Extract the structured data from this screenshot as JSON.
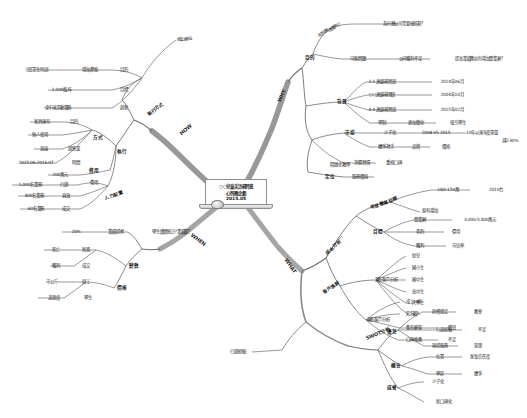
{
  "document": {
    "type": "mind-map",
    "title_lines": [
      "○○兒童美語補習班",
      "心智圖企劃",
      "2015.05"
    ],
    "center_icon": "laptop-icon"
  },
  "branches": [
    {
      "id": "why",
      "label": "WHY",
      "color": "#7a7a7a",
      "children": [
        {
          "label": "目的",
          "children": [
            {
              "label": "如何營運獲利？",
              "children": [
                {
                  "label": "為什麼公司需要被規劃？"
                }
              ]
            },
            {
              "label": "可能問題",
              "children": [
                {
                  "label": "公司獲利不足",
                  "children": [
                    {
                      "label": "提高業績應如何增加營業額？"
                    }
                  ]
                }
              ]
            }
          ]
        },
        {
          "label": "背景",
          "children": [
            {
              "label": "1-1 連鎖補習班",
              "value": "2014年06月"
            },
            {
              "label": "○○連鎖補習班",
              "value": "2004年10月"
            },
            {
              "label": "4-4 連鎖補習班",
              "value": "2015年02月"
            },
            {
              "label": "學制",
              "value": "更加簡化",
              "extra": "吸引學生"
            }
          ]
        },
        {
          "label": "市場",
          "children": [
            {
              "label": "少子化",
              "value": "2008 VS 2015",
              "extra": "10年以來年度單量",
              "extra2": "減少30%"
            },
            {
              "label": "競爭對手",
              "value": "品質",
              "extra": "價格"
            },
            {
              "label": "消費習慣",
              "value": "重視口碑"
            }
          ]
        },
        {
          "label": "定位",
          "children": [
            {
              "label": "服務價值"
            },
            {
              "label": "精緻化教學"
            }
          ]
        }
      ]
    },
    {
      "id": "what",
      "label": "WHAT",
      "color": "#8a8a8a",
      "children": [
        {
          "label": "成本分析",
          "children": [
            {
              "label": "年度營業目標",
              "children": [
                {
                  "label": "U$0-170萬",
                  "value": "2010台"
                },
                {
                  "label": "原有增加"
                }
              ]
            },
            {
              "label": "目標",
              "children": [
                {
                  "label": "營業額",
                  "value": "3,000-5,400萬元"
                },
                {
                  "label": "毛利",
                  "value": "費用"
                },
                {
                  "label": "獲利",
                  "value": "市佔率"
                }
              ]
            }
          ]
        },
        {
          "label": "客戶族群",
          "children": [
            {
              "label": "潛在客戶分析",
              "children": [
                {
                  "label": "幼兒"
                },
                {
                  "label": "國小生"
                },
                {
                  "label": "國中生"
                },
                {
                  "label": "高中生"
                },
                {
                  "label": "大學生"
                },
                {
                  "label": "老人"
                }
              ]
            },
            {
              "label": "現有客戶分析",
              "children": [
                {
                  "label": "成立18年"
                },
                {
                  "label": "知名度"
                },
                {
                  "label": "舊有顧客",
                  "value": "續班"
                },
                {
                  "label": "口碑推薦",
                  "value": "不足"
                }
              ]
            }
          ]
        }
      ]
    },
    {
      "id": "swot",
      "label": "SWOT分析",
      "color": "#6f6f6f",
      "children": [
        {
          "label": "優勢",
          "children": [
            {
              "label": "師資穩定",
              "value": "教室"
            },
            {
              "label": "行銷經驗",
              "value": "不足"
            },
            {
              "label": "現場服務",
              "value": "管理"
            }
          ]
        },
        {
          "label": "機會",
          "children": [
            {
              "label": "位置",
              "value": "家長信任度"
            },
            {
              "label": "學區",
              "value": "競爭"
            }
          ]
        },
        {
          "label": "威脅",
          "children": [
            {
              "label": "少子化"
            },
            {
              "label": "新口碑化"
            }
          ]
        }
      ]
    },
    {
      "id": "when",
      "label": "WHEN",
      "color": "#8a8a8a",
      "children": [
        {
          "label": "20%",
          "value": "業績提昇",
          "extra": "學生續讀統計?業績量？"
        },
        {
          "label": "變數",
          "children": [
            {
              "label": "死亡",
              "value": "新進"
            },
            {
              "label": "獲利",
              "value": "成交"
            }
          ]
        },
        {
          "label": "價格",
          "children": [
            {
              "label": "市公斤",
              "value": "員工"
            },
            {
              "label": "滿意度",
              "value": "學生"
            }
          ]
        }
      ]
    },
    {
      "id": "how",
      "label": "HOW",
      "color": "#8a8a8a",
      "children": [
        {
          "label": "執行方式",
          "children": [
            {
              "label": "成立網站",
              "children": [
                {
                  "label": "小班單生特訓",
                  "value": "增加產能",
                  "extra": "目的"
                },
                {
                  "label": "1,000瓶/年",
                  "value": "目標"
                },
                {
                  "label": "全干球活動業務",
                  "value": "創新"
                }
              ]
            }
          ]
        },
        {
          "label": "執行",
          "children": [
            {
              "label": "方式",
              "children": [
                {
                  "label": "家具庫存",
                  "value": "目的"
                },
                {
                  "label": "無人使用",
                  "value": ""
                },
                {
                  "label": "直接",
                  "value": "銷售量"
                },
                {
                  "label": "2015.06-2016.07",
                  "value": "時間"
                }
              ]
            },
            {
              "label": "費用",
              "children": [
                {
                  "label": "200萬元",
                  "value": "費用"
                }
              ]
            },
            {
              "label": "人力配置",
              "children": [
                {
                  "label": "1,000名業務",
                  "value": "行銷"
                },
                {
                  "label": "400名業務",
                  "value": "直效"
                },
                {
                  "label": "60名業務",
                  "value": "成交"
                }
              ]
            }
          ]
        }
      ]
    }
  ]
}
